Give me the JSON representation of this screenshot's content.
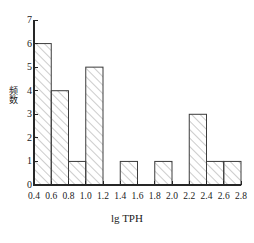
{
  "chart_data": {
    "type": "bar",
    "title": "",
    "subtitle": "",
    "xlabel": "lg TPH",
    "ylabel": "频数",
    "categories": [
      "0.4-0.6",
      "0.6-0.8",
      "0.8-1.0",
      "1.0-1.2",
      "1.2-1.4",
      "1.4-1.6",
      "1.6-1.8",
      "1.8-2.0",
      "2.0-2.2",
      "2.2-2.4",
      "2.4-2.6",
      "2.6-2.8"
    ],
    "bin_edges": [
      0.4,
      0.6,
      0.8,
      1.0,
      1.2,
      1.4,
      1.6,
      1.8,
      2.0,
      2.2,
      2.4,
      2.6,
      2.8
    ],
    "values": [
      6,
      4,
      1,
      5,
      0,
      1,
      0,
      1,
      0,
      3,
      1,
      1
    ],
    "xlim": [
      0.4,
      2.8
    ],
    "ylim": [
      0,
      7
    ],
    "xticks": [
      "0.4",
      "0.6",
      "0.8",
      "1.0",
      "1.2",
      "1.4",
      "1.6",
      "1.8",
      "2.0",
      "2.2",
      "2.4",
      "2.6",
      "2.8"
    ],
    "xtick_values": [
      0.4,
      0.6,
      0.8,
      1.0,
      1.2,
      1.4,
      1.6,
      1.8,
      2.0,
      2.2,
      2.4,
      2.6,
      2.8
    ],
    "yticks": [
      "0",
      "1",
      "2",
      "3",
      "4",
      "5",
      "6",
      "7"
    ],
    "ytick_values": [
      0,
      1,
      2,
      3,
      4,
      5,
      6,
      7
    ],
    "grid": false,
    "legend": null,
    "bar_fill": "hatch-diagonal",
    "bar_edge_color": "#3c3c3c",
    "axis_color": "#262626",
    "background": "#ffffff"
  }
}
